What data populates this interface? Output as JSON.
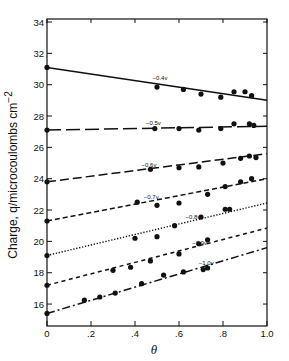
{
  "chart_data": {
    "type": "scatter",
    "title": "",
    "xlabel": "θ",
    "ylabel": "Charge, q/microcoulombs cm",
    "ylabel_superscript": "−2",
    "xlim": [
      0,
      1.0
    ],
    "ylim": [
      14.6,
      34.2
    ],
    "x_ticks": [
      "0",
      ".2",
      ".4",
      ".6",
      ".8",
      "1.0"
    ],
    "x_tick_values": [
      0,
      0.2,
      0.4,
      0.6,
      0.8,
      1.0
    ],
    "y_ticks": [
      "16",
      "18",
      "20",
      "22",
      "24",
      "26",
      "28",
      "30",
      "32",
      "34"
    ],
    "y_tick_values": [
      16,
      18,
      20,
      22,
      24,
      26,
      28,
      30,
      32,
      34
    ],
    "grid": false,
    "legend": "inline labels on each line",
    "series": [
      {
        "name": "−0.4v",
        "line_style": "solid",
        "fit": {
          "x0": 0,
          "y0": 31.1,
          "x1": 1.0,
          "y1": 29.0
        },
        "points": [
          [
            0,
            31.1
          ],
          [
            0.5,
            29.85
          ],
          [
            0.62,
            29.7
          ],
          [
            0.7,
            29.4
          ],
          [
            0.79,
            29.2
          ],
          [
            0.85,
            29.55
          ],
          [
            0.9,
            29.55
          ],
          [
            0.93,
            29.3
          ]
        ],
        "label_x": 0.48
      },
      {
        "name": "−0.5v",
        "line_style": "long-dash",
        "fit": {
          "x0": 0,
          "y0": 27.1,
          "x1": 1.0,
          "y1": 27.35
        },
        "points": [
          [
            0,
            27.1
          ],
          [
            0.49,
            27.2
          ],
          [
            0.6,
            27.2
          ],
          [
            0.69,
            27.1
          ],
          [
            0.79,
            27.2
          ],
          [
            0.85,
            27.5
          ],
          [
            0.92,
            27.5
          ],
          [
            0.94,
            27.4
          ]
        ],
        "label_x": 0.45
      },
      {
        "name": "−0.6v",
        "line_style": "dash",
        "fit": {
          "x0": 0,
          "y0": 23.8,
          "x1": 1.0,
          "y1": 25.6
        },
        "points": [
          [
            0,
            23.8
          ],
          [
            0.47,
            24.6
          ],
          [
            0.6,
            24.7
          ],
          [
            0.69,
            24.75
          ],
          [
            0.8,
            25.0
          ],
          [
            0.88,
            25.3
          ],
          [
            0.92,
            25.45
          ],
          [
            0.95,
            25.35
          ]
        ],
        "label_x": 0.43
      },
      {
        "name": "−0.7v",
        "line_style": "short-dash",
        "fit": {
          "x0": 0,
          "y0": 21.3,
          "x1": 1.0,
          "y1": 24.0
        },
        "points": [
          [
            0,
            21.3
          ],
          [
            0.41,
            22.5
          ],
          [
            0.5,
            22.3
          ],
          [
            0.6,
            22.45
          ],
          [
            0.73,
            23.0
          ],
          [
            0.81,
            23.5
          ],
          [
            0.88,
            23.8
          ],
          [
            0.93,
            24.0
          ]
        ],
        "label_x": 0.44
      },
      {
        "name": "−0.8v",
        "line_style": "dotted",
        "fit": {
          "x0": 0,
          "y0": 19.1,
          "x1": 1.0,
          "y1": 22.45
        },
        "points": [
          [
            0,
            19.1
          ],
          [
            0.4,
            20.2
          ],
          [
            0.5,
            20.3
          ],
          [
            0.58,
            21.0
          ],
          [
            0.7,
            21.55
          ],
          [
            0.81,
            22.05
          ],
          [
            0.83,
            22.05
          ]
        ],
        "label_x": 0.63
      },
      {
        "name": "−0.9v",
        "line_style": "dash-small",
        "fit": {
          "x0": 0,
          "y0": 17.2,
          "x1": 1.0,
          "y1": 20.85
        },
        "points": [
          [
            0,
            17.2
          ],
          [
            0.3,
            18.15
          ],
          [
            0.38,
            18.35
          ],
          [
            0.47,
            18.75
          ],
          [
            0.6,
            19.2
          ],
          [
            0.69,
            19.85
          ],
          [
            0.73,
            20.1
          ]
        ],
        "label_x": 0.66
      },
      {
        "name": "−1.0v",
        "line_style": "dash-dot",
        "fit": {
          "x0": 0,
          "y0": 15.4,
          "x1": 1.0,
          "y1": 19.6
        },
        "points": [
          [
            0,
            15.4
          ],
          [
            0.17,
            16.25
          ],
          [
            0.24,
            16.45
          ],
          [
            0.31,
            16.7
          ],
          [
            0.43,
            17.3
          ],
          [
            0.53,
            17.85
          ],
          [
            0.62,
            18.05
          ],
          [
            0.71,
            18.2
          ],
          [
            0.73,
            18.3
          ]
        ],
        "label_x": 0.69
      }
    ]
  }
}
